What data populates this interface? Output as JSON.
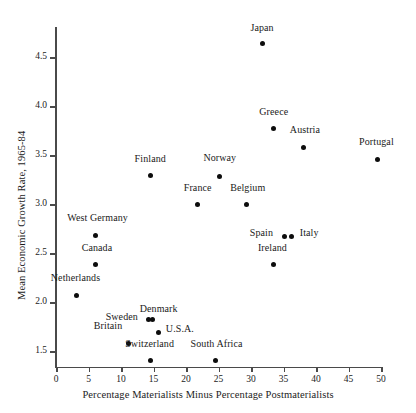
{
  "chart_data": {
    "type": "scatter",
    "title": "",
    "xlabel": "Percentage Materialists Minus Percentage Postmaterialists",
    "ylabel": "Mean Economic Growth Rate, 1965-84",
    "xlim": [
      0,
      50
    ],
    "ylim": [
      1.3,
      4.8
    ],
    "grid": false,
    "legend": "none",
    "xticks": [
      0,
      5,
      10,
      15,
      20,
      25,
      30,
      35,
      40,
      45,
      50
    ],
    "xtick_labels": [
      "0",
      "5",
      "10",
      "15",
      "20",
      "25",
      "30",
      "35",
      "40",
      "45",
      "50"
    ],
    "yticks": [
      1.5,
      2.0,
      2.5,
      3.0,
      3.5,
      4.0,
      4.5
    ],
    "ytick_labels": [
      "1.5",
      "2.0",
      "2.5",
      "3.0",
      "3.5",
      "4.0",
      "4.5"
    ],
    "point_color": "#0d0d0d",
    "axis_color": "#4a4a4a",
    "points": [
      {
        "label": "Japan",
        "x": 31.7,
        "y": 4.64,
        "lx": 31.7,
        "ly": 4.79,
        "align": "center"
      },
      {
        "label": "Greece",
        "x": 33.5,
        "y": 3.77,
        "lx": 33.5,
        "ly": 3.93,
        "align": "center"
      },
      {
        "label": "Austria",
        "x": 38.0,
        "y": 3.58,
        "lx": 38.3,
        "ly": 3.75,
        "align": "center"
      },
      {
        "label": "Portugal",
        "x": 49.4,
        "y": 3.45,
        "lx": 49.3,
        "ly": 3.62,
        "align": "center"
      },
      {
        "label": "Finland",
        "x": 14.5,
        "y": 3.29,
        "lx": 14.5,
        "ly": 3.45,
        "align": "center"
      },
      {
        "label": "Norway",
        "x": 25.2,
        "y": 3.28,
        "lx": 25.2,
        "ly": 3.46,
        "align": "center"
      },
      {
        "label": "France",
        "x": 21.8,
        "y": 2.99,
        "lx": 21.8,
        "ly": 3.15,
        "align": "center"
      },
      {
        "label": "Belgium",
        "x": 29.3,
        "y": 2.99,
        "lx": 29.5,
        "ly": 3.15,
        "align": "center"
      },
      {
        "label": "West Germany",
        "x": 6.1,
        "y": 2.68,
        "lx": 6.4,
        "ly": 2.85,
        "align": "center"
      },
      {
        "label": "Canada",
        "x": 6.1,
        "y": 2.38,
        "lx": 6.3,
        "ly": 2.54,
        "align": "center"
      },
      {
        "label": "Netherlands",
        "x": 3.2,
        "y": 2.07,
        "lx": 3.0,
        "ly": 2.23,
        "align": "center"
      },
      {
        "label": "Spain",
        "x": 35.2,
        "y": 2.67,
        "lx": 33.4,
        "ly": 2.69,
        "align": "right"
      },
      {
        "label": "Italy",
        "x": 36.3,
        "y": 2.67,
        "lx": 37.5,
        "ly": 2.69,
        "align": "left"
      },
      {
        "label": "Ireland",
        "x": 33.4,
        "y": 2.38,
        "lx": 33.3,
        "ly": 2.54,
        "align": "center"
      },
      {
        "label": "Sweden",
        "x": 14.2,
        "y": 1.82,
        "lx": 12.6,
        "ly": 1.84,
        "align": "right"
      },
      {
        "label": "Denmark",
        "x": 14.8,
        "y": 1.82,
        "lx": 15.8,
        "ly": 1.92,
        "align": "center"
      },
      {
        "label": "Britain",
        "x": 11.1,
        "y": 1.58,
        "lx": 10.2,
        "ly": 1.74,
        "align": "right"
      },
      {
        "label": "U.S.A.",
        "x": 15.7,
        "y": 1.69,
        "lx": 16.9,
        "ly": 1.71,
        "align": "left"
      },
      {
        "label": "Switzerland",
        "x": 14.5,
        "y": 1.4,
        "lx": 14.4,
        "ly": 1.56,
        "align": "center"
      },
      {
        "label": "South Africa",
        "x": 24.6,
        "y": 1.4,
        "lx": 24.7,
        "ly": 1.56,
        "align": "center"
      }
    ]
  }
}
